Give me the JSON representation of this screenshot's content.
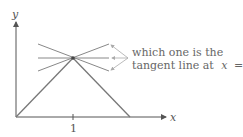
{
  "figure": {
    "axes": {
      "x_label": "x",
      "y_label": "y",
      "x_tick_label": "1"
    },
    "annotation": {
      "line1": "which one is the",
      "line2_prefix": "tangent line at",
      "line2_var": "x",
      "line2_eq": "= 1?"
    },
    "colors": {
      "curve": "#777777",
      "axis": "#555555",
      "pointer": "#aaaaaa",
      "text": "#666666"
    }
  }
}
